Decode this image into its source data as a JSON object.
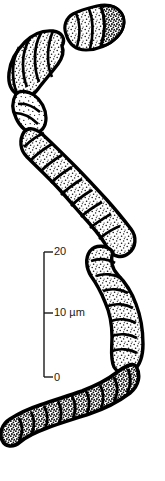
{
  "figure": {
    "kind": "scientific-line-drawing",
    "caption_text": "",
    "subject_name": "segmented-filamentous-organism",
    "colors": {
      "background": "#ffffff",
      "ink": "#000000",
      "cell_fill": "#ffffff",
      "stipple": "#111111",
      "scale_bar": "#1a1a1a"
    }
  },
  "scale_bar": {
    "name": "vertical-scale-bar",
    "unit": "µm",
    "axis_x": 44,
    "tick_length": 9,
    "ticks": [
      {
        "label": "20",
        "value": 20,
        "y": 252
      },
      {
        "label": "10 µm",
        "value": 10,
        "y": 313
      },
      {
        "label": "0",
        "value": 0,
        "y": 377
      }
    ]
  },
  "organism": {
    "name": "trichome-filament",
    "description": "curved chain of stippled cells",
    "detached_fragment": {
      "name": "detached-cell-fragment",
      "cell_count": 3
    },
    "main_filament": {
      "name": "main-filament",
      "cell_count": 30
    }
  }
}
